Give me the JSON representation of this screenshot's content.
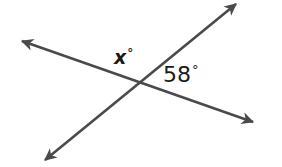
{
  "figure": {
    "background_color": "#ffffff",
    "stroke_color": "#4a4a4a",
    "stroke_width": 2.6,
    "text_color": "#1a1a1a",
    "labels": {
      "unknown_angle": "x",
      "unknown_angle_degree_symbol": "°",
      "known_angle": "58",
      "known_angle_degree_symbol": "°"
    },
    "geometry": {
      "intersection": {
        "x": 139,
        "y": 82
      },
      "lines": [
        {
          "name": "line-upper-left-to-lower-right",
          "from": {
            "x": 22,
            "y": 41
          },
          "to": {
            "x": 253,
            "y": 122
          },
          "arrow_start": true,
          "arrow_end": true
        },
        {
          "name": "line-lower-left-to-upper-right",
          "from": {
            "x": 45,
            "y": 160
          },
          "to": {
            "x": 236,
            "y": 4
          },
          "arrow_start": true,
          "arrow_end": true
        }
      ]
    }
  }
}
